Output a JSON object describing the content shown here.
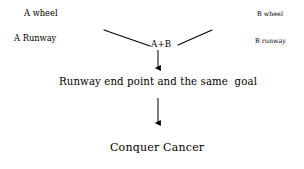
{
  "diagram": {
    "type": "flow-diagram",
    "background_color": "#ffffff",
    "ink_color": "#000000",
    "left_labels": [
      {
        "text": "A wheel",
        "x": 24,
        "y": 9
      },
      {
        "text": "A Runway",
        "x": 14,
        "y": 34
      }
    ],
    "right_labels": [
      {
        "text": "B wheel",
        "x": 257,
        "y": 11
      },
      {
        "text": "B runway",
        "x": 255,
        "y": 38
      }
    ],
    "center_node": {
      "text": "A+B",
      "x": 151,
      "y": 40
    },
    "middle_statement": {
      "text": "Runway end point and the same  goal",
      "x": 59,
      "y": 77
    },
    "bottom_statement": {
      "text": "Conquer Cancer",
      "x": 110,
      "y": 142
    },
    "connectors": [
      {
        "name": "left-diagonal",
        "x1": 104,
        "y1": 30,
        "x2": 150,
        "y2": 46
      },
      {
        "name": "right-diagonal",
        "x1": 178,
        "y1": 45,
        "x2": 212,
        "y2": 30
      },
      {
        "name": "arrow-to-goal",
        "x1": 158,
        "y1": 50,
        "x2": 158,
        "y2": 73
      },
      {
        "name": "arrow-to-conquer",
        "x1": 158,
        "y1": 98,
        "x2": 158,
        "y2": 128
      }
    ]
  }
}
